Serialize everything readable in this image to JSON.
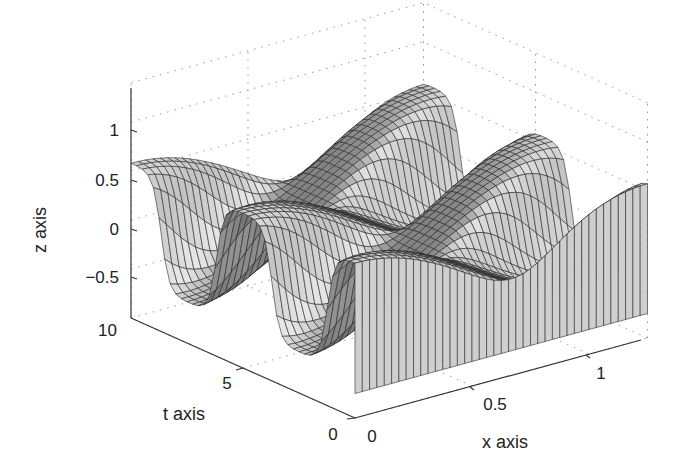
{
  "chart_data": {
    "type": "surface",
    "title": "",
    "xlabel": "x axis",
    "ylabel": "t axis",
    "zlabel": "z axis",
    "xlim": [
      0,
      1.25
    ],
    "tlim": [
      0,
      10
    ],
    "zlim": [
      -1,
      1.4
    ],
    "x_ticks": [
      0,
      0.5,
      1
    ],
    "x_tick_labels": [
      "0",
      "0.5",
      "1"
    ],
    "t_ticks": [
      0,
      5,
      10
    ],
    "t_tick_labels": [
      "0",
      "5",
      "10"
    ],
    "z_ticks": [
      -0.5,
      0,
      0.5,
      1
    ],
    "z_tick_labels": [
      "−0.5",
      "0",
      "0.5",
      "1"
    ],
    "grid": true,
    "surface": {
      "description": "Wave solution z(x,t) = cos(pi*x/0.6)*cos-like travelling wave; ridges appear periodically along t",
      "x_samples": 40,
      "t_samples": 40,
      "function": "z = 0.55*cos(2.6*x) * sat(cos(1.3*t - 2.2*x))"
    },
    "colormap": "gray",
    "face_color_range": [
      "#6e6e6e",
      "#e6e6e6"
    ],
    "edge_color": "#2a2a2a"
  },
  "labels": {
    "x_axis": "x axis",
    "t_axis": "t axis",
    "z_axis": "z axis",
    "z_tick_m05": "−0.5",
    "z_tick_0": "0",
    "z_tick_05": "0.5",
    "z_tick_1": "1",
    "t_tick_10": "10",
    "t_tick_5": "5",
    "t_tick_0": "0",
    "x_tick_0": "0",
    "x_tick_05": "0.5",
    "x_tick_1": "1"
  }
}
